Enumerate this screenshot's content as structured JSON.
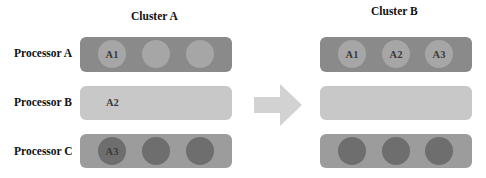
{
  "clusters": [
    {
      "title": "Cluster A"
    },
    {
      "title": "Cluster B"
    }
  ],
  "processors": [
    {
      "label": "Processor A"
    },
    {
      "label": "Processor B"
    },
    {
      "label": "Processor C"
    }
  ],
  "cluster_a": {
    "processor_a": [
      "A1",
      "",
      ""
    ],
    "processor_b": "A2",
    "processor_c": [
      "A3",
      "",
      ""
    ]
  },
  "cluster_b": {
    "processor_a": [
      "A1",
      "A2",
      "A3"
    ],
    "processor_b": "",
    "processor_c": [
      "",
      "",
      ""
    ]
  },
  "colors": {
    "processor_a_bar": "#8a8a8a",
    "processor_b_bar": "#c8c8c8",
    "processor_c_bar": "#9c9c9c",
    "light_slot": "#a6a6a6",
    "dark_slot": "#6e6e6e",
    "arrow": "#d2d2d2"
  }
}
